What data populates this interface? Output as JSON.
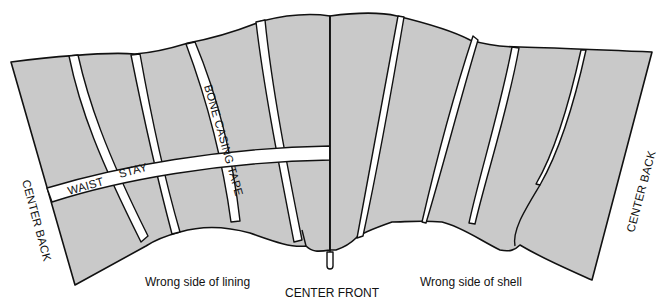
{
  "diagram": {
    "type": "sewing-construction-illustration",
    "fill_color": "#c9c9c9",
    "stroke_color": "#111111",
    "tape_color": "#ffffff",
    "labels": {
      "center_back_left": "CENTER BACK",
      "center_back_right": "CENTER BACK",
      "center_front": "CENTER FRONT",
      "waist": "WAIST",
      "stay": "STAY",
      "bone_casing_tape": "BONE CASING TAPE"
    },
    "captions": {
      "lining": "Wrong side of lining",
      "shell": "Wrong side of shell"
    },
    "panels": [
      {
        "name": "lining",
        "side": "left",
        "bone_casings": 4,
        "has_waist_stay": true
      },
      {
        "name": "shell",
        "side": "right",
        "seams": 4,
        "has_waist_stay": false
      }
    ]
  }
}
